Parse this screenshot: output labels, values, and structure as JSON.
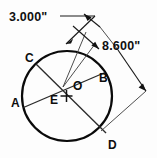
{
  "drawing": {
    "title": "Circle with intersecting chords",
    "background_color": "#fdfdfd",
    "line_color": "#0a0a0a",
    "dimensions": [
      {
        "id": "dim-3000",
        "label": "3.000\"",
        "value": 3.0,
        "unit": "inch",
        "position": "top-left"
      },
      {
        "id": "dim-8600",
        "label": "8.600\"",
        "value": 8.6,
        "unit": "inch",
        "position": "top-right"
      }
    ],
    "points": [
      {
        "id": "point-a",
        "label": "A",
        "x": 17,
        "y": 103,
        "location": "left"
      },
      {
        "id": "point-b",
        "label": "B",
        "x": 99,
        "y": 78,
        "location": "right"
      },
      {
        "id": "point-c",
        "label": "C",
        "x": 29,
        "y": 58,
        "location": "upper-left"
      },
      {
        "id": "point-d",
        "label": "D",
        "x": 113,
        "y": 145,
        "location": "lower-right"
      },
      {
        "id": "point-e",
        "label": "E",
        "x": 56,
        "y": 100,
        "location": "center-left"
      },
      {
        "id": "point-o",
        "label": "O",
        "x": 78,
        "y": 91,
        "location": "center"
      }
    ],
    "circle": {
      "center_x": 67,
      "center_y": 96,
      "radius": 45
    }
  }
}
